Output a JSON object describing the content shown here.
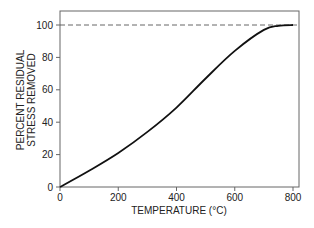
{
  "chart_data": {
    "type": "line",
    "title": "",
    "xlabel": "TEMPERATURE (°C)",
    "ylabel": [
      "PERCENT RESIDUAL",
      "STRESS REMOVED"
    ],
    "xlim": [
      0,
      800
    ],
    "ylim": [
      0,
      100
    ],
    "xticks": [
      0,
      200,
      400,
      600,
      800
    ],
    "yticks": [
      0,
      20,
      40,
      60,
      80,
      100
    ],
    "grid": false,
    "legend": null,
    "reference_line": {
      "y": 100,
      "style": "dashed"
    },
    "series": [
      {
        "name": "Residual stress removed",
        "x": [
          0,
          100,
          200,
          300,
          400,
          500,
          600,
          700,
          750,
          800
        ],
        "values": [
          0,
          10,
          21,
          34,
          49,
          67,
          84,
          97,
          99.5,
          100
        ]
      }
    ]
  }
}
